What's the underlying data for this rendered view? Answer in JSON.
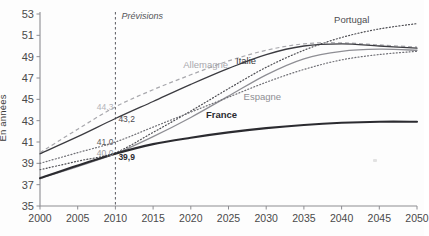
{
  "axes": {
    "ylabel": "En années",
    "yticks": [
      35,
      37,
      39,
      41,
      43,
      45,
      47,
      49,
      51,
      53
    ],
    "xticks": [
      2000,
      2005,
      2010,
      2015,
      2020,
      2025,
      2030,
      2035,
      2040,
      2045,
      2050
    ]
  },
  "annotations": {
    "forecast_label": "Prévisions",
    "forecast_year": 2010
  },
  "chart_data": {
    "type": "line",
    "title": "",
    "xlabel": "",
    "ylabel": "En années",
    "xlim": [
      2000,
      2050
    ],
    "ylim": [
      35,
      53
    ],
    "grid": false,
    "legend": "inline-labels",
    "x": [
      2000,
      2005,
      2010,
      2015,
      2020,
      2025,
      2030,
      2035,
      2040,
      2045,
      2050
    ],
    "series": [
      {
        "name": "Portugal",
        "style": "dotted",
        "color": "#4d4d52",
        "label_x": 2039,
        "label_y": 52.4,
        "values": [
          38.4,
          39.2,
          40.0,
          41.9,
          43.9,
          46.0,
          48.0,
          49.6,
          50.8,
          51.6,
          52.1
        ],
        "start_label": "40,0",
        "start_label_year": 2010
      },
      {
        "name": "Allemagne",
        "style": "dashed",
        "color": "#a8a8ad",
        "label_x": 2019,
        "label_y": 48.2,
        "values": [
          40.0,
          42.2,
          44.3,
          45.9,
          47.3,
          48.6,
          49.6,
          50.2,
          50.3,
          50.1,
          49.9
        ],
        "start_label": "44,3",
        "start_label_year": 2010
      },
      {
        "name": "Italie",
        "style": "solid",
        "color": "#3b3b40",
        "label_x": 2026,
        "label_y": 48.6,
        "values": [
          39.9,
          41.5,
          43.2,
          44.8,
          46.4,
          47.9,
          49.2,
          50.0,
          50.2,
          50.0,
          49.8
        ],
        "start_label": "43,2",
        "start_label_year": 2010
      },
      {
        "name": "Espagne",
        "style": "solid",
        "color": "#8e8e94",
        "label_x": 2027,
        "label_y": 45.2,
        "values": [
          37.6,
          38.7,
          39.9,
          41.5,
          43.3,
          45.3,
          47.3,
          48.8,
          49.5,
          49.7,
          49.6
        ],
        "start_label": "39,9",
        "start_label_year": 2010
      },
      {
        "name": "France",
        "style": "solid-bold",
        "color": "#2b2b30",
        "label_x": 2022,
        "label_y": 43.5,
        "values": [
          37.6,
          38.8,
          39.9,
          40.8,
          41.4,
          41.9,
          42.3,
          42.6,
          42.8,
          42.9,
          42.9
        ],
        "start_label": "39,9",
        "start_label_year": 2010
      },
      {
        "name": "reference-dotted-low",
        "style": "dotted",
        "color": "#6f6f75",
        "label_x": null,
        "label_y": null,
        "values": [
          39.0,
          40.0,
          41.0,
          42.4,
          43.8,
          45.2,
          46.6,
          47.8,
          48.7,
          49.2,
          49.5
        ],
        "start_label": "41,0",
        "start_label_year": 2010
      }
    ],
    "data_labels": [
      {
        "text": "44,3",
        "year": 2010,
        "value": 44.3,
        "color": "#b4b4b9"
      },
      {
        "text": "43,2",
        "year": 2010,
        "value": 43.2,
        "color": "#4a4a4f"
      },
      {
        "text": "41,0",
        "year": 2010,
        "value": 41.0,
        "color": "#5a5a60"
      },
      {
        "text": "40,0",
        "year": 2010,
        "value": 40.0,
        "color": "#9a9aa0"
      },
      {
        "text": "39,9",
        "year": 2010,
        "value": 39.6,
        "color": "#2b2b30"
      }
    ]
  }
}
